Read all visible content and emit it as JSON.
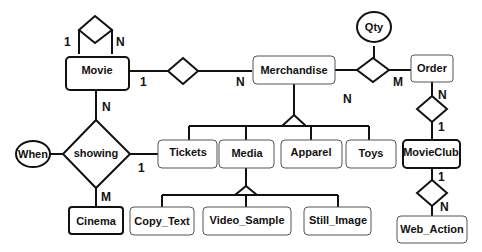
{
  "diagram": {
    "type": "ER diagram",
    "entities": {
      "movie": "Movie",
      "merchandise": "Merchandise",
      "order": "Order",
      "cinema": "Cinema",
      "tickets": "Tickets",
      "media": "Media",
      "apparel": "Apparel",
      "toys": "Toys",
      "movieclub": "MovieClub",
      "copy_text": "Copy_Text",
      "video_sample": "Video_Sample",
      "still_image": "Still_Image",
      "web_action": "Web_Action"
    },
    "relationships": {
      "showing": "showing"
    },
    "attributes": {
      "qty": "Qty",
      "when": "When"
    },
    "cardinalities": {
      "movie_self_left": "1",
      "movie_self_right": "N",
      "movie_merch_movie": "1",
      "movie_merch_merch": "N",
      "merch_order_merch": "N",
      "merch_order_order": "M",
      "movie_showing": "N",
      "showing_tickets": "1",
      "showing_cinema": "M",
      "order_movieclub_order": "N",
      "order_movieclub_club": "1",
      "club_web_club": "1",
      "club_web_web": "N"
    }
  }
}
